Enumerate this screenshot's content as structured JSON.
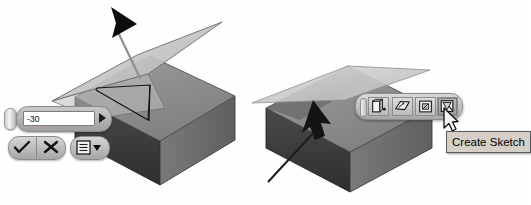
{
  "scene": {
    "title": "Work plane angle edit and create-sketch mini toolbar",
    "colors": {
      "box_top": "#8e8e8e",
      "box_front": "#3a3a3a",
      "box_side": "#6f6f6f",
      "plane_fill": "#c3c3c3",
      "plane_edge": "#6a6a6a",
      "sketch_edge": "#1a1a1a",
      "handle": "#101010",
      "leader": "#8b8b8b",
      "tooltip_bg": "#d4d0c8",
      "chrome": "#b4b4b4"
    }
  },
  "angle_widget": {
    "name": "angle-value",
    "value": "-30",
    "placeholder": "0",
    "grip_label": "drag-handle",
    "expand_label": "more"
  },
  "confirm_cluster": {
    "ok_label": "OK",
    "ok_icon": "checkmark-icon",
    "cancel_label": "Cancel",
    "cancel_icon": "cross-icon",
    "options_label": "Options",
    "options_icon": "list-menu-icon",
    "options_dropdown_icon": "caret-down-icon"
  },
  "mini_toolbar": {
    "handle_label": "toolbar-grip",
    "buttons": [
      {
        "name": "extrude-button",
        "icon": "extrude-icon",
        "label": "Extrude",
        "pressed": false
      },
      {
        "name": "offset-plane-button",
        "icon": "offset-plane-icon",
        "label": "Offset Plane",
        "pressed": false
      },
      {
        "name": "edit-feature-button",
        "icon": "edit-feature-icon",
        "label": "Edit Feature",
        "pressed": false
      },
      {
        "name": "create-sketch-button",
        "icon": "create-sketch-icon",
        "label": "Create Sketch",
        "pressed": true
      }
    ]
  },
  "tooltip": {
    "text": "Create Sketch",
    "for": "create-sketch-button"
  },
  "pointer": {
    "cursor_icon": "arrow-cursor",
    "selection_arrow_icon": "selection-arrow-icon"
  }
}
